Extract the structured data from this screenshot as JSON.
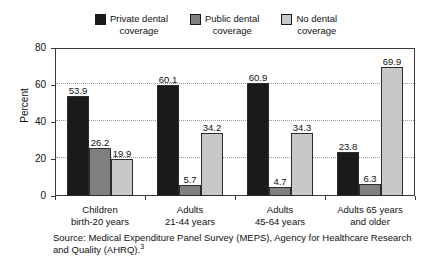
{
  "chart_data": {
    "type": "bar",
    "title": "",
    "xlabel": "",
    "ylabel": "Percent",
    "ylim": [
      0,
      80
    ],
    "yticks": [
      0,
      20,
      40,
      60,
      80
    ],
    "grid": true,
    "legend_position": "top-center",
    "categories": [
      "Children\nbirth-20 years",
      "Adults\n21-44 years",
      "Adults\n45-64 years",
      "Adults 65 years\nand older"
    ],
    "series": [
      {
        "name": "Private dental\ncoverage",
        "color": "#1a1a1a",
        "values": [
          53.9,
          60.1,
          60.9,
          23.8
        ],
        "labels": [
          "53.9",
          "60.1",
          "60.9",
          "23.8"
        ]
      },
      {
        "name": "Public dental\ncoverage",
        "color": "#808080",
        "values": [
          26.2,
          5.7,
          4.7,
          6.3
        ],
        "labels": [
          "26.2",
          "5.7",
          "4.7",
          "6.3"
        ]
      },
      {
        "name": "No dental\ncoverage",
        "color": "#c8c8c8",
        "values": [
          19.9,
          34.2,
          34.3,
          69.9
        ],
        "labels": [
          "19.9",
          "34.2",
          "34.3",
          "69.9"
        ]
      }
    ],
    "ytick_labels": [
      "0",
      "20",
      "40",
      "60",
      "80"
    ]
  },
  "source": {
    "text": "Source: Medical Expenditure Panel Survey (MEPS), Agency for Healthcare Research and Quality (AHRQ).",
    "footnote_marker": "3"
  }
}
